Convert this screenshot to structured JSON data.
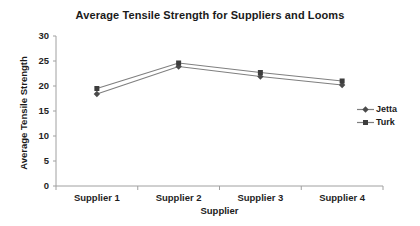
{
  "chart_data": {
    "type": "line",
    "title": "Average Tensile Strength for Suppliers and Looms",
    "xlabel": "Supplier",
    "ylabel": "Average Tensile Strength",
    "categories": [
      "Supplier 1",
      "Supplier 2",
      "Supplier 3",
      "Supplier 4"
    ],
    "series": [
      {
        "name": "Jetta",
        "marker": "diamond",
        "values": [
          18.4,
          23.9,
          21.9,
          20.2
        ],
        "line_color": "#7f7f7f",
        "marker_color": "#4a4a4a"
      },
      {
        "name": "Turk",
        "marker": "square",
        "values": [
          19.5,
          24.6,
          22.7,
          21.0
        ],
        "line_color": "#7f7f7f",
        "marker_color": "#3d3d3d"
      }
    ],
    "ylim": [
      0,
      30
    ],
    "ytick_step": 5,
    "yticks": [
      0,
      5,
      10,
      15,
      20,
      25,
      30
    ],
    "grid": false,
    "legend_position": "right"
  },
  "colors": {
    "background": "#ffffff",
    "axis_line": "#a0a0a0",
    "tick_text": "#1f1f1f"
  }
}
